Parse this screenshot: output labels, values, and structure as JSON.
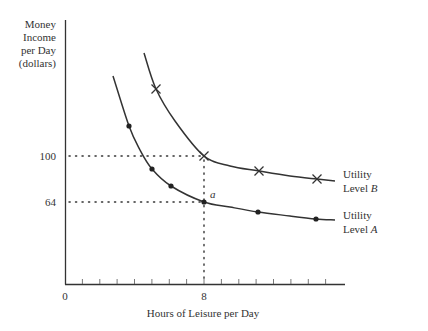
{
  "chart_data": {
    "type": "line",
    "title": "",
    "xlabel": "Hours of Leisure per Day",
    "ylabel": [
      "Money",
      "Income",
      "per Day",
      "(dollars)"
    ],
    "x_ticks": [
      {
        "value": 0,
        "label": "0"
      },
      {
        "value": 8,
        "label": "8"
      }
    ],
    "y_ticks": [
      {
        "value": 64,
        "label": "64"
      },
      {
        "value": 100,
        "label": "100"
      }
    ],
    "xlim": [
      0,
      16
    ],
    "grid": false,
    "series": [
      {
        "name": "Utility Level B",
        "label_line1": "Utility",
        "label_line2_prefix": "Level ",
        "label_line2_italic": "B",
        "marker": "x",
        "points_px": [
          [
            144,
            53
          ],
          [
            156,
            89
          ],
          [
            175,
            121
          ],
          [
            204,
            156
          ],
          [
            230,
            166
          ],
          [
            259,
            171
          ],
          [
            290,
            176
          ],
          [
            317,
            179
          ],
          [
            335,
            181
          ]
        ],
        "markers_px": [
          [
            156,
            89
          ],
          [
            204,
            156
          ],
          [
            259,
            171
          ],
          [
            317,
            179
          ]
        ]
      },
      {
        "name": "Utility Level A",
        "label_line1": "Utility",
        "label_line2_prefix": "Level ",
        "label_line2_italic": "A",
        "marker": "dot",
        "points_px": [
          [
            113,
            76
          ],
          [
            129,
            126
          ],
          [
            140,
            150
          ],
          [
            152,
            169
          ],
          [
            171,
            186
          ],
          [
            204,
            202
          ],
          [
            230,
            207
          ],
          [
            258,
            212
          ],
          [
            290,
            216
          ],
          [
            316,
            219
          ],
          [
            335,
            220
          ]
        ],
        "markers_px": [
          [
            129,
            126
          ],
          [
            152,
            169
          ],
          [
            171,
            186
          ],
          [
            204,
            202
          ],
          [
            258,
            212
          ],
          [
            316,
            219
          ]
        ]
      }
    ],
    "annotations": [
      {
        "text": "a",
        "italic": true,
        "at": "point on Utility Level A at (8, 64)"
      },
      {
        "type": "dotted-guides",
        "description": "Dotted lines from y-axis at 100 and 64 to x=8, and vertical dotted line from x=8 down to the x-axis"
      }
    ],
    "highlight_point_a": {
      "x": 8,
      "y": 64
    },
    "highlight_point_b": {
      "x": 8,
      "y": 100
    }
  }
}
